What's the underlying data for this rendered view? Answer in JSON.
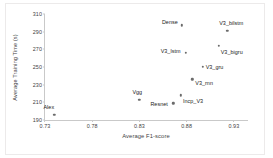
{
  "chart_data": {
    "type": "scatter",
    "title": "",
    "xlabel": "Average F1-score",
    "ylabel": "Average Training Time (s)",
    "xlim": [
      0.73,
      0.945
    ],
    "ylim": [
      190,
      310
    ],
    "xticks": [
      "0.73",
      "0.78",
      "0.83",
      "0.88",
      "0.93"
    ],
    "xtick_values": [
      0.73,
      0.78,
      0.83,
      0.88,
      0.93
    ],
    "yticks": [
      "310",
      "290",
      "270",
      "250",
      "230",
      "210",
      "190"
    ],
    "ytick_values": [
      310,
      290,
      270,
      250,
      230,
      210,
      190
    ],
    "grid": false,
    "legend": "none",
    "marker_color": "#6b6b6b",
    "axis_color": "#c9c9c9",
    "points": [
      {
        "label": "Alex",
        "x": 0.74,
        "y": 196
      },
      {
        "label": "Vgg",
        "x": 0.83,
        "y": 213
      },
      {
        "label": "Resnet",
        "x": 0.866,
        "y": 209
      },
      {
        "label": "Incp_V3",
        "x": 0.874,
        "y": 218
      },
      {
        "label": "Dense",
        "x": 0.875,
        "y": 297
      },
      {
        "label": "V3_lstm",
        "x": 0.879,
        "y": 266
      },
      {
        "label": "V3_rnn",
        "x": 0.886,
        "y": 236
      },
      {
        "label": "V3_gru",
        "x": 0.897,
        "y": 250
      },
      {
        "label": "V3_bigru",
        "x": 0.914,
        "y": 274
      },
      {
        "label": "V3_bilstm",
        "x": 0.923,
        "y": 291
      }
    ]
  },
  "labels": {
    "alex": "Alex",
    "vgg": "Vgg",
    "resnet": "Resnet",
    "incp_v3": "Incp_V3",
    "dense": "Dense",
    "v3_lstm": "V3_lstm",
    "v3_rnn": "V3_rnn",
    "v3_gru": "V3_gru",
    "v3_bigru": "V3_bigru",
    "v3_bilstm": "V3_bilstm"
  }
}
